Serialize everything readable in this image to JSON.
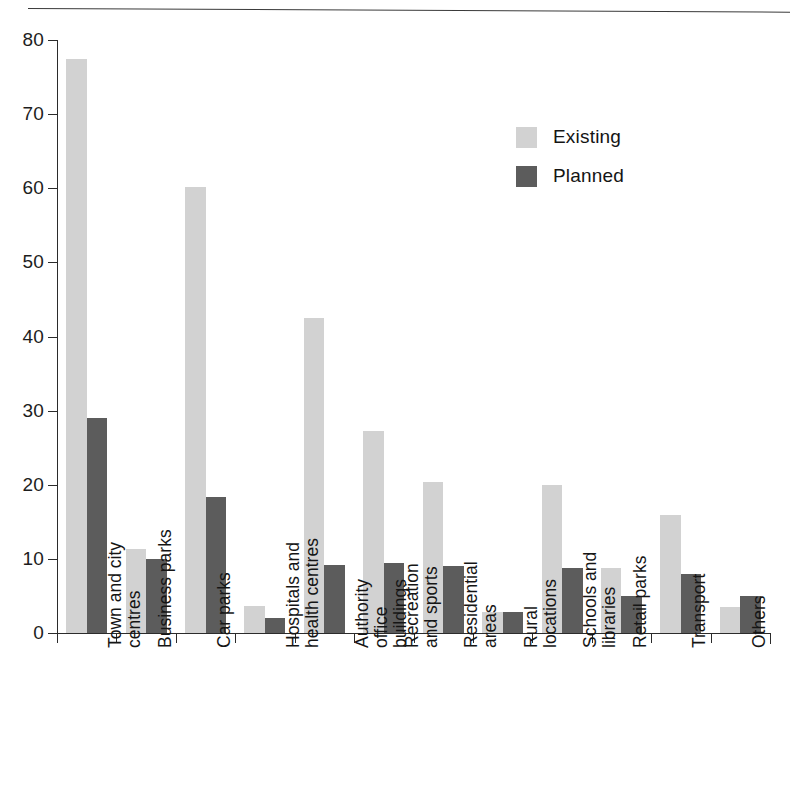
{
  "chart_data": {
    "type": "bar",
    "title": "",
    "subtitle": "",
    "xlabel": "",
    "ylabel": "",
    "ylim": [
      0,
      80
    ],
    "yticks": [
      0,
      10,
      20,
      30,
      40,
      50,
      60,
      70,
      80
    ],
    "ytick_labels": [
      "0",
      "10",
      "20",
      "30",
      "40",
      "50",
      "60",
      "70",
      "80"
    ],
    "grid": false,
    "legend_position": "upper-right-inside",
    "categories": [
      "Town and city centres",
      "Business parks",
      "Car parks",
      "Hospitals and health centres",
      "Authority office buildings",
      "Recreation and sports",
      "Residential areas",
      "Rural locations",
      "Schools and libraries",
      "Retail parks",
      "Transport",
      "Others"
    ],
    "category_lines": [
      [
        "Town and city",
        "centres"
      ],
      [
        "Business parks"
      ],
      [
        "Car parks"
      ],
      [
        "Hospitals and",
        "health centres"
      ],
      [
        "Authority",
        "office",
        "buildings"
      ],
      [
        "Recreation",
        "and sports"
      ],
      [
        "Residential",
        "areas"
      ],
      [
        "Rural",
        "locations"
      ],
      [
        "Schools and",
        "libraries"
      ],
      [
        "Retail parks"
      ],
      [
        "Transport"
      ],
      [
        "Others"
      ]
    ],
    "series": [
      {
        "name": "Existing",
        "color": "#d2d2d2",
        "values": [
          77.5,
          11.3,
          60.2,
          3.7,
          42.5,
          27.3,
          20.4,
          2.9,
          20.0,
          8.8,
          15.9,
          3.5
        ]
      },
      {
        "name": "Planned",
        "color": "#5c5c5c",
        "values": [
          29.0,
          10.0,
          18.3,
          2.0,
          9.2,
          9.4,
          9.0,
          2.9,
          8.8,
          5.0,
          8.0,
          5.0
        ]
      }
    ]
  },
  "legend": {
    "items": [
      {
        "label": "Existing",
        "color": "#d2d2d2"
      },
      {
        "label": "Planned",
        "color": "#5c5c5c"
      }
    ]
  }
}
